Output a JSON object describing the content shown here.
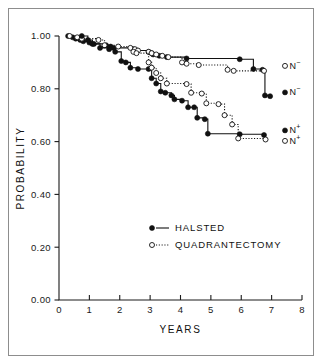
{
  "figure": {
    "title": "",
    "frame_color": "#8d8d8d",
    "ink_color": "#111111",
    "background": "#ffffff"
  },
  "axes": {
    "x": {
      "label": "YEARS",
      "ticks": [
        "0",
        "1",
        "2",
        "3",
        "4",
        "5",
        "6",
        "7",
        "8"
      ],
      "min": 0,
      "max": 8
    },
    "y": {
      "label": "PROBABILITY",
      "ticks": [
        "1.00",
        "0.80",
        "0.60",
        "0.40",
        "0.20",
        "0.00"
      ],
      "tick_values": [
        1.0,
        0.8,
        0.6,
        0.4,
        0.2,
        0.0
      ],
      "min": 0.0,
      "max": 1.0
    }
  },
  "legend": {
    "items": [
      {
        "label": "HALSTED",
        "marker": "filled-circle",
        "line": "solid"
      },
      {
        "label": "QUADRANTECTOMY",
        "marker": "open-circle",
        "line": "dotted"
      }
    ]
  },
  "curve_labels": [
    {
      "id": "quad-n-neg",
      "marker": "open-circle",
      "base": "N",
      "sup": "−"
    },
    {
      "id": "halsted-n-neg",
      "marker": "filled-circle",
      "base": "N",
      "sup": "−"
    },
    {
      "id": "halsted-n-pos",
      "marker": "filled-circle",
      "base": "N",
      "sup": "+"
    },
    {
      "id": "quad-n-pos",
      "marker": "open-circle",
      "base": "N",
      "sup": "+"
    }
  ],
  "chart_data": {
    "type": "line",
    "title": "",
    "xlabel": "YEARS",
    "ylabel": "PROBABILITY",
    "xlim": [
      0,
      8
    ],
    "ylim": [
      0.0,
      1.0
    ],
    "xticks": [
      0,
      1,
      2,
      3,
      4,
      5,
      6,
      7,
      8
    ],
    "yticks": [
      0.0,
      0.2,
      0.4,
      0.6,
      0.8,
      1.0
    ],
    "grid": false,
    "legend_position": "center-right-lower",
    "plot_style": "kaplan-meier step curves with event markers",
    "series": [
      {
        "name": "HALSTED N−",
        "group": "HALSTED",
        "nodal_status": "N-",
        "marker": "filled-circle",
        "line": "solid",
        "label_at_end": "N−",
        "points": [
          [
            0.3,
            1.0
          ],
          [
            0.45,
            0.995
          ],
          [
            0.55,
            0.99
          ],
          [
            0.7,
            0.985
          ],
          [
            0.8,
            0.98
          ],
          [
            1.0,
            0.975
          ],
          [
            1.15,
            0.97
          ],
          [
            1.55,
            0.965
          ],
          [
            1.7,
            0.96
          ],
          [
            1.8,
            0.955
          ],
          [
            2.45,
            0.95
          ],
          [
            2.55,
            0.945
          ],
          [
            2.95,
            0.94
          ],
          [
            3.05,
            0.935
          ],
          [
            3.1,
            0.93
          ],
          [
            3.3,
            0.925
          ],
          [
            3.55,
            0.92
          ],
          [
            4.2,
            0.915
          ],
          [
            5.95,
            0.912
          ],
          [
            6.4,
            0.875
          ],
          [
            6.7,
            0.872
          ],
          [
            6.78,
            0.775
          ],
          [
            6.95,
            0.772
          ]
        ]
      },
      {
        "name": "QUADRANTECTOMY N−",
        "group": "QUADRANTECTOMY",
        "nodal_status": "N-",
        "marker": "open-circle",
        "line": "dotted",
        "label_at_end": "N−",
        "points": [
          [
            0.35,
            1.0
          ],
          [
            0.6,
            0.995
          ],
          [
            0.75,
            0.99
          ],
          [
            1.3,
            0.985
          ],
          [
            1.5,
            0.965
          ],
          [
            1.95,
            0.96
          ],
          [
            2.35,
            0.955
          ],
          [
            2.5,
            0.95
          ],
          [
            2.6,
            0.945
          ],
          [
            2.95,
            0.94
          ],
          [
            3.05,
            0.935
          ],
          [
            3.2,
            0.93
          ],
          [
            3.4,
            0.925
          ],
          [
            3.6,
            0.92
          ],
          [
            4.05,
            0.9
          ],
          [
            4.2,
            0.895
          ],
          [
            4.6,
            0.89
          ],
          [
            5.55,
            0.872
          ],
          [
            5.75,
            0.868
          ],
          [
            6.75,
            0.868
          ]
        ]
      },
      {
        "name": "HALSTED N+",
        "group": "HALSTED",
        "nodal_status": "N+",
        "marker": "filled-circle",
        "line": "solid",
        "label_at_end": "N+",
        "points": [
          [
            0.75,
            1.0
          ],
          [
            0.95,
            0.985
          ],
          [
            1.1,
            0.97
          ],
          [
            1.35,
            0.955
          ],
          [
            1.65,
            0.95
          ],
          [
            1.85,
            0.94
          ],
          [
            2.05,
            0.905
          ],
          [
            2.2,
            0.9
          ],
          [
            2.35,
            0.88
          ],
          [
            2.6,
            0.875
          ],
          [
            2.95,
            0.875
          ],
          [
            3.05,
            0.84
          ],
          [
            3.2,
            0.82
          ],
          [
            3.35,
            0.79
          ],
          [
            3.5,
            0.785
          ],
          [
            3.7,
            0.775
          ],
          [
            3.8,
            0.76
          ],
          [
            4.05,
            0.755
          ],
          [
            4.25,
            0.73
          ],
          [
            4.45,
            0.73
          ],
          [
            4.55,
            0.69
          ],
          [
            4.8,
            0.685
          ],
          [
            4.9,
            0.63
          ],
          [
            5.95,
            0.628
          ],
          [
            6.75,
            0.625
          ]
        ]
      },
      {
        "name": "QUADRANTECTOMY N+",
        "group": "QUADRANTECTOMY",
        "nodal_status": "N+",
        "marker": "open-circle",
        "line": "dotted",
        "label_at_end": "N+",
        "points": [
          [
            2.45,
            0.94
          ],
          [
            2.55,
            0.935
          ],
          [
            2.95,
            0.9
          ],
          [
            3.05,
            0.88
          ],
          [
            3.2,
            0.86
          ],
          [
            3.35,
            0.84
          ],
          [
            3.55,
            0.82
          ],
          [
            4.2,
            0.818
          ],
          [
            4.35,
            0.785
          ],
          [
            4.7,
            0.782
          ],
          [
            4.85,
            0.745
          ],
          [
            5.25,
            0.742
          ],
          [
            5.45,
            0.7
          ],
          [
            5.7,
            0.665
          ],
          [
            5.9,
            0.612
          ],
          [
            6.8,
            0.608
          ]
        ]
      }
    ]
  }
}
